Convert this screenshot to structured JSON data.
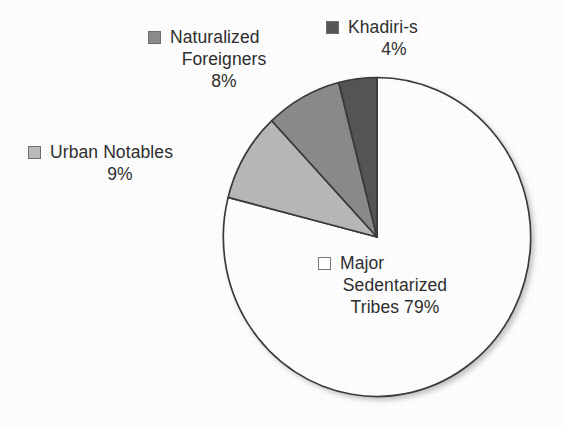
{
  "chart_data": {
    "type": "pie",
    "title": "",
    "subtitle": "",
    "xlabel": "",
    "ylabel": "",
    "legend_position": "callout-labels",
    "grid": false,
    "start_angle_deg": 90,
    "direction": "counterclockwise",
    "categories": [
      "Khadiri-s",
      "Naturalized Foreigners",
      "Urban Notables",
      "Major Sedentarized Tribes"
    ],
    "values": [
      4,
      8,
      9,
      79
    ],
    "value_suffix": "%",
    "colors": [
      "#565656",
      "#8b8b8b",
      "#b9b9b9",
      "#ffffff"
    ],
    "slices": [
      {
        "label": "Khadiri-s",
        "value": 4,
        "value_text": "4%",
        "color": "#565656",
        "swatch": "sw-dark"
      },
      {
        "label": "Naturalized Foreigners",
        "value": 8,
        "value_text": "8%",
        "color": "#8b8b8b",
        "swatch": "sw-mid"
      },
      {
        "label": "Urban Notables",
        "value": 9,
        "value_text": "9%",
        "color": "#b9b9b9",
        "swatch": "sw-light"
      },
      {
        "label": "Major Sedentarized Tribes",
        "value": 79,
        "value_text": "79%",
        "color": "#ffffff",
        "swatch": "sw-white"
      }
    ],
    "outline_color": "#3a3a3a",
    "background": "#ffffff"
  },
  "labels": {
    "khadiris": {
      "line1": "Khadiri-s",
      "line2": "4%"
    },
    "naturalized": {
      "line1": "Naturalized",
      "line2": "Foreigners",
      "line3": "8%"
    },
    "urban": {
      "line1": "Urban Notables",
      "line2": "9%"
    },
    "major": {
      "line1": "Major",
      "line2": "Sedentarized",
      "line3": "Tribes 79%"
    }
  }
}
